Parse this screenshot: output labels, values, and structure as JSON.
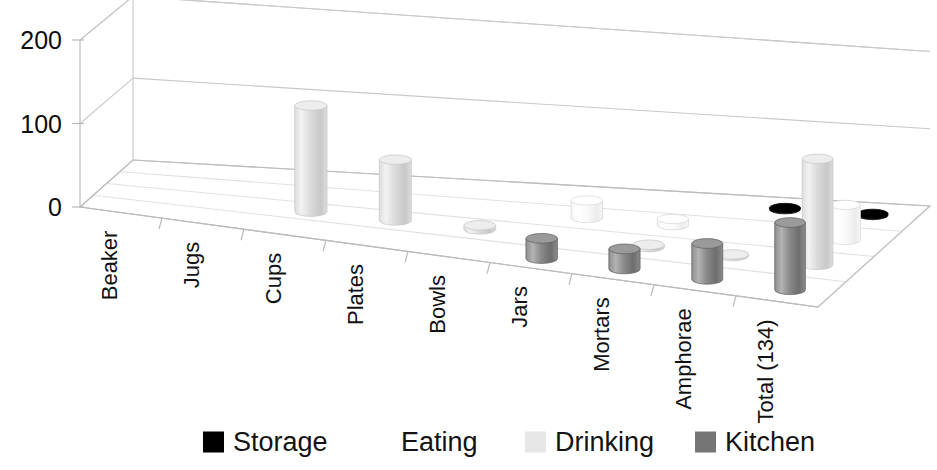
{
  "chart_data": {
    "type": "bar",
    "subtype": "3d-cylinder-bar",
    "title": "",
    "xlabel": "",
    "ylabel": "",
    "ylim": [
      0,
      200
    ],
    "ytick_values": [
      0,
      100,
      200
    ],
    "ytick_labels": [
      "0",
      "100",
      "200"
    ],
    "grid": true,
    "legend_position": "bottom",
    "categories": [
      "Beaker",
      "Jugs",
      "Cups",
      "Plates",
      "Bowls",
      "Jars",
      "Mortars",
      "Amphorae",
      "Total (134)"
    ],
    "series": [
      {
        "name": "Kitchen",
        "color": "#808080",
        "depth_index": 0,
        "values": [
          0,
          0,
          0,
          0,
          0,
          25,
          25,
          45,
          85
        ]
      },
      {
        "name": "Drinking",
        "color": "#e8e8e8",
        "depth_index": 1,
        "values": [
          0,
          0,
          130,
          75,
          5,
          0,
          3,
          2,
          135
        ]
      },
      {
        "name": "Eating",
        "color": "#ffffff",
        "depth_index": 2,
        "values": [
          0,
          0,
          0,
          0,
          0,
          22,
          8,
          0,
          45
        ]
      },
      {
        "name": "Storage",
        "color": "#000000",
        "depth_index": 3,
        "values": [
          0,
          0,
          0,
          0,
          0,
          0,
          0,
          2,
          2
        ]
      }
    ]
  },
  "legend": {
    "items": [
      {
        "label": "Storage",
        "color": "#000000",
        "swatch": "storage-swatch"
      },
      {
        "label": "Eating",
        "color": "#ffffff",
        "swatch": "eating-swatch"
      },
      {
        "label": "Drinking",
        "color": "#e6e6e6",
        "swatch": "drinking-swatch"
      },
      {
        "label": "Kitchen",
        "color": "#757575",
        "swatch": "kitchen-swatch"
      }
    ]
  },
  "axes": {
    "y_labels": [
      "200",
      "100",
      "0"
    ],
    "x_labels": [
      "Beaker",
      "Jugs",
      "Cups",
      "Plates",
      "Bowls",
      "Jars",
      "Mortars",
      "Amphorae",
      "Total (134)"
    ]
  }
}
